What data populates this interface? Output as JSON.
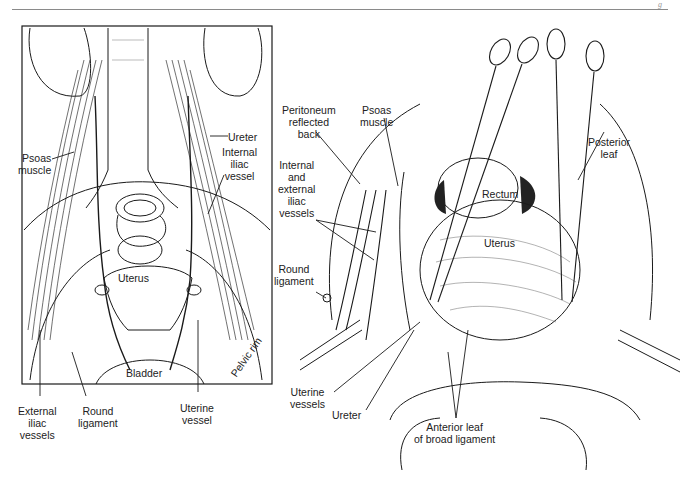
{
  "page": {
    "header_fragment": "g"
  },
  "left_figure": {
    "title": "Anterior view of pelvic retroperitoneal anatomy",
    "labels": {
      "ureter": "Ureter",
      "internal_iliac_vessel": "Internal\niliac\nvessel",
      "psoas_muscle": "Psoas\nmuscle",
      "uterus": "Uterus",
      "bladder": "Bladder",
      "pelvic_rim": "Pelvic rim",
      "external_iliac_vessels": "External\niliac\nvessels",
      "round_ligament": "Round\nligament",
      "uterine_vessel": "Uterine\nvessel"
    }
  },
  "right_figure": {
    "title": "Operative view with clamps on uterus",
    "labels": {
      "peritoneum_reflected_back": "Peritoneum\nreflected\nback",
      "psoas_muscle": "Psoas\nmuscle",
      "posterior_leaf": "Posterior\nleaf",
      "internal_external_iliac_vessels": "Internal\nand\nexternal\niliac\nvessels",
      "rectum": "Rectum",
      "uterus": "Uterus",
      "round_ligament": "Round\nligament",
      "uterine_vessels": "Uterine\nvessels",
      "ureter": "Ureter",
      "anterior_leaf_broad_ligament": "Anterior leaf\nof broad ligament"
    }
  },
  "colors": {
    "ink": "#1a1a1a",
    "rule": "#8a8a8a",
    "background": "#ffffff"
  }
}
